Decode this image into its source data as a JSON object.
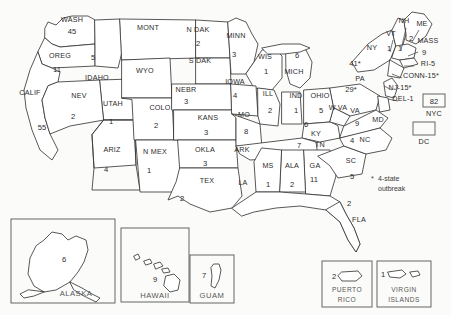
{
  "legend": {
    "marker": "*",
    "text": "4-state outbreak"
  },
  "chart_data": {
    "type": "map",
    "subtitle": "",
    "value_label": "cases",
    "annotations": [
      "* 4-state outbreak"
    ],
    "states": [
      {
        "code": "WASH",
        "label": "WASH",
        "value": "45",
        "x": 72,
        "y": 22,
        "nx": 72,
        "ny": 34
      },
      {
        "code": "OREG",
        "label": "OREG",
        "value": "11",
        "x": 60,
        "y": 58,
        "nx": 57,
        "ny": 72
      },
      {
        "code": "IDAHO",
        "label": "IDAHO",
        "value": "5",
        "x": 97,
        "y": 80,
        "nx": 93,
        "ny": 60
      },
      {
        "code": "MONT",
        "label": "MONT",
        "value": "",
        "x": 148,
        "y": 30,
        "nx": 148,
        "ny": 45
      },
      {
        "code": "NDAK",
        "label": "N DAK",
        "value": "2",
        "x": 198,
        "y": 32,
        "nx": 198,
        "ny": 46
      },
      {
        "code": "SDAK",
        "label": "S DAK",
        "value": "",
        "x": 200,
        "y": 63,
        "nx": 200,
        "ny": 76
      },
      {
        "code": "MINN",
        "label": "MINN",
        "value": "3",
        "x": 236,
        "y": 38,
        "nx": 234,
        "ny": 57
      },
      {
        "code": "WIS",
        "label": "WIS",
        "value": "1",
        "x": 265,
        "y": 59,
        "nx": 266,
        "ny": 74
      },
      {
        "code": "MICH",
        "label": "MICH",
        "value": "6",
        "x": 294,
        "y": 74,
        "nx": 297,
        "ny": 58
      },
      {
        "code": "WYO",
        "label": "WYO",
        "value": "",
        "x": 145,
        "y": 73,
        "nx": 145,
        "ny": 86
      },
      {
        "code": "NEBR",
        "label": "NEBR",
        "value": "3",
        "x": 186,
        "y": 92,
        "nx": 186,
        "ny": 104
      },
      {
        "code": "IOWA",
        "label": "IOWA",
        "value": "4",
        "x": 235,
        "y": 84,
        "nx": 235,
        "ny": 98
      },
      {
        "code": "ILL",
        "label": "ILL",
        "value": "2",
        "x": 268,
        "y": 96,
        "nx": 270,
        "ny": 113
      },
      {
        "code": "IND",
        "label": "IND",
        "value": "1",
        "x": 296,
        "y": 98,
        "nx": 296,
        "ny": 113
      },
      {
        "code": "OHIO",
        "label": "OHIO",
        "value": "5",
        "x": 320,
        "y": 98,
        "nx": 321,
        "ny": 113
      },
      {
        "code": "CALIF",
        "label": "CALIF",
        "value": "55",
        "x": 30,
        "y": 95,
        "nx": 42,
        "ny": 130
      },
      {
        "code": "NEV",
        "label": "NEV",
        "value": "2",
        "x": 79,
        "y": 98,
        "nx": 73,
        "ny": 119
      },
      {
        "code": "UTAH",
        "label": "UTAH",
        "value": "1",
        "x": 113,
        "y": 106,
        "nx": 111,
        "ny": 124
      },
      {
        "code": "COLO",
        "label": "COLO",
        "value": "2",
        "x": 160,
        "y": 110,
        "nx": 156,
        "ny": 128
      },
      {
        "code": "KANS",
        "label": "KANS",
        "value": "3",
        "x": 208,
        "y": 120,
        "nx": 206,
        "ny": 135
      },
      {
        "code": "MO",
        "label": "MO",
        "value": "8",
        "x": 244,
        "y": 117,
        "nx": 246,
        "ny": 134
      },
      {
        "code": "KY",
        "label": "KY",
        "value": "6",
        "x": 316,
        "y": 136,
        "nx": 306,
        "ny": 127
      },
      {
        "code": "ARIZ",
        "label": "ARIZ",
        "value": "4",
        "x": 112,
        "y": 152,
        "nx": 106,
        "ny": 172
      },
      {
        "code": "NMEX",
        "label": "N MEX",
        "value": "1",
        "x": 155,
        "y": 154,
        "nx": 149,
        "ny": 173
      },
      {
        "code": "OKLA",
        "label": "OKLA",
        "value": "3",
        "x": 205,
        "y": 152,
        "nx": 205,
        "ny": 166
      },
      {
        "code": "TEX",
        "label": "TEX",
        "value": "2",
        "x": 207,
        "y": 183,
        "nx": 182,
        "ny": 201
      },
      {
        "code": "ARK",
        "label": "ARK",
        "value": "",
        "x": 242,
        "y": 152,
        "nx": 244,
        "ny": 164
      },
      {
        "code": "LA",
        "label": "LA",
        "value": "",
        "x": 243,
        "y": 185,
        "nx": 243,
        "ny": 196
      },
      {
        "code": "MS",
        "label": "MS",
        "value": "1",
        "x": 268,
        "y": 168,
        "nx": 268,
        "ny": 187
      },
      {
        "code": "ALA",
        "label": "ALA",
        "value": "2",
        "x": 292,
        "y": 168,
        "nx": 292,
        "ny": 187
      },
      {
        "code": "GA",
        "label": "GA",
        "value": "11",
        "x": 315,
        "y": 168,
        "nx": 314,
        "ny": 182
      },
      {
        "code": "TN",
        "label": "TN",
        "value": "7",
        "x": 320,
        "y": 147,
        "nx": 299,
        "ny": 148
      },
      {
        "code": "SC",
        "label": "SC",
        "value": "5",
        "x": 351,
        "y": 163,
        "nx": 352,
        "ny": 179
      },
      {
        "code": "NC",
        "label": "NC",
        "value": "4",
        "x": 365,
        "y": 142,
        "nx": 352,
        "ny": 143
      },
      {
        "code": "VA",
        "label": "VA",
        "value": "9",
        "x": 355,
        "y": 113,
        "nx": 357,
        "ny": 126
      },
      {
        "code": "WVA",
        "label": "W VA",
        "value": "",
        "x": 338,
        "y": 110,
        "nx": 338,
        "ny": 110
      },
      {
        "code": "MD",
        "label": "MD",
        "value": "",
        "x": 378,
        "y": 122,
        "nx": 378,
        "ny": 122
      },
      {
        "code": "PA",
        "label": "PA",
        "value": "29*",
        "x": 360,
        "y": 81,
        "nx": 351,
        "ny": 92
      },
      {
        "code": "NY",
        "label": "NY",
        "value": "41*",
        "x": 372,
        "y": 50,
        "nx": 355,
        "ny": 66
      },
      {
        "code": "FLA",
        "label": "FLA",
        "value": "2",
        "x": 359,
        "y": 222,
        "nx": 349,
        "ny": 206
      },
      {
        "code": "VT",
        "label": "VT",
        "value": "1",
        "x": 391,
        "y": 36,
        "nx": 389,
        "ny": 51
      },
      {
        "code": "NH",
        "label": "NH",
        "value": "1",
        "x": 404,
        "y": 23,
        "nx": 400,
        "ny": 51
      },
      {
        "code": "ME",
        "label": "ME",
        "value": "2",
        "x": 422,
        "y": 26,
        "nx": 411,
        "ny": 41
      },
      {
        "code": "MASS",
        "label": "MASS",
        "value": "9",
        "x": 428,
        "y": 43,
        "nx": 424,
        "ny": 55
      },
      {
        "code": "RI",
        "label": "RI-5",
        "value": "",
        "x": 428,
        "y": 66,
        "nx": 0,
        "ny": 0
      },
      {
        "code": "CONN",
        "label": "CONN-15*",
        "value": "",
        "x": 421,
        "y": 78,
        "nx": 0,
        "ny": 0
      },
      {
        "code": "NJ",
        "label": "NJ-15*",
        "value": "",
        "x": 400,
        "y": 90,
        "nx": 0,
        "ny": 0
      },
      {
        "code": "DEL",
        "label": "DEL-1",
        "value": "",
        "x": 403,
        "y": 101,
        "nx": 0,
        "ny": 0
      }
    ],
    "boxed_cities": [
      {
        "label": "NYC",
        "value": "82",
        "x": 434,
        "y": 103
      },
      {
        "label": "DC",
        "value": "",
        "x": 424,
        "y": 131
      }
    ],
    "insets": [
      {
        "label": "ALASKA",
        "value": "6"
      },
      {
        "label": "HAWAII",
        "value": "9"
      },
      {
        "label": "GUAM",
        "value": "7"
      },
      {
        "label": "PUERTO RICO",
        "value": "2"
      },
      {
        "label": "VIRGIN ISLANDS",
        "value": "1"
      }
    ]
  }
}
